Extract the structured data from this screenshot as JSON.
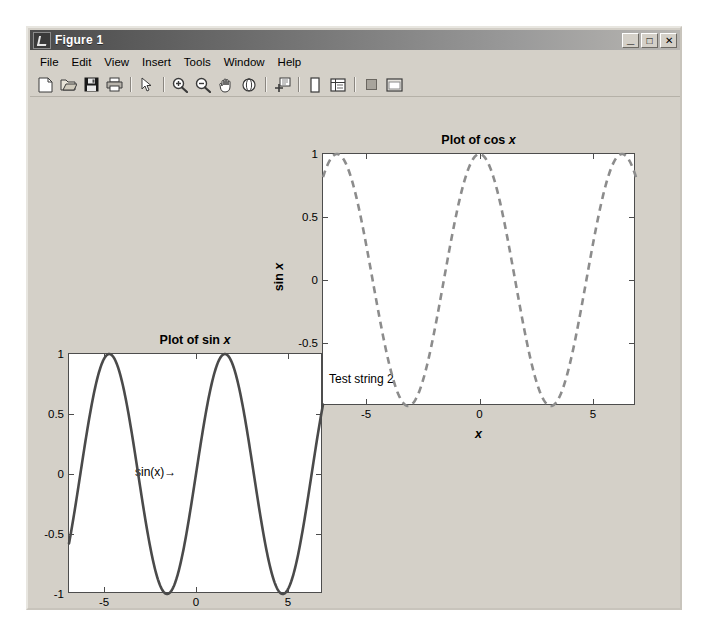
{
  "window": {
    "title": "Figure 1",
    "icon": "matlab-figure-icon",
    "buttons": {
      "minimize": "_",
      "maximize": "□",
      "close": "✕"
    }
  },
  "menubar": {
    "items": [
      {
        "label": "File",
        "name": "menu-file"
      },
      {
        "label": "Edit",
        "name": "menu-edit"
      },
      {
        "label": "View",
        "name": "menu-view"
      },
      {
        "label": "Insert",
        "name": "menu-insert"
      },
      {
        "label": "Tools",
        "name": "menu-tools"
      },
      {
        "label": "Window",
        "name": "menu-window"
      },
      {
        "label": "Help",
        "name": "menu-help"
      }
    ]
  },
  "toolbar": {
    "items": [
      {
        "name": "new-figure-icon"
      },
      {
        "name": "open-file-icon"
      },
      {
        "name": "save-figure-icon"
      },
      {
        "name": "print-figure-icon"
      },
      {
        "name": "separator"
      },
      {
        "name": "edit-plot-pointer-icon"
      },
      {
        "name": "separator"
      },
      {
        "name": "zoom-in-icon"
      },
      {
        "name": "zoom-out-icon"
      },
      {
        "name": "pan-hand-icon"
      },
      {
        "name": "rotate-3d-icon"
      },
      {
        "name": "separator"
      },
      {
        "name": "data-cursor-icon"
      },
      {
        "name": "separator"
      },
      {
        "name": "insert-colorbar-icon"
      },
      {
        "name": "insert-legend-icon"
      },
      {
        "name": "separator"
      },
      {
        "name": "hide-plot-tools-icon"
      },
      {
        "name": "show-plot-tools-icon"
      }
    ]
  },
  "chart_data": [
    {
      "id": "cos-plot",
      "type": "line",
      "title": "Plot of cos x",
      "title_plain": "Plot of cos ",
      "title_italic": "x",
      "xlabel": "x",
      "ylabel": "sin x",
      "ylabel_plain": "sin ",
      "ylabel_italic": "x",
      "xlim": [
        -6.9,
        6.9
      ],
      "ylim": [
        -1,
        1
      ],
      "xticks": [
        -5,
        0,
        5
      ],
      "xticklabels": [
        "-5",
        "0",
        "5"
      ],
      "yticks": [
        -1,
        -0.5,
        0,
        0.5,
        1
      ],
      "yticklabels": [
        "-1",
        "-0.5",
        "0",
        "0.5",
        "1"
      ],
      "grid": false,
      "linestyle": "dashed",
      "color": "#8c8c8c",
      "linewidth": 2.4,
      "series": [
        {
          "name": "cos(x)",
          "function": "cos",
          "amplitude": 1,
          "period": 6.2832
        }
      ],
      "annotations": [
        {
          "name": "test-string-2-annotation",
          "text": "Test string 2",
          "x": -6.3,
          "y": -0.82
        }
      ]
    },
    {
      "id": "sin-plot",
      "type": "line",
      "title": "Plot of sin x",
      "title_plain": "Plot of sin ",
      "title_italic": "x",
      "xlabel": "",
      "ylabel": "",
      "xlim": [
        -6.9,
        6.9
      ],
      "ylim": [
        -1,
        1
      ],
      "xticks": [
        -5,
        0,
        5
      ],
      "xticklabels": [
        "-5",
        "0",
        "5"
      ],
      "yticks": [
        -1,
        -0.5,
        0,
        0.5,
        1
      ],
      "yticklabels": [
        "-1",
        "-0.5",
        "0",
        "0.5",
        "1"
      ],
      "grid": false,
      "linestyle": "solid",
      "color": "#4a4a4a",
      "linewidth": 2.4,
      "series": [
        {
          "name": "sin(x)",
          "function": "sin",
          "amplitude": 1,
          "period": 6.2832
        }
      ],
      "annotations": [
        {
          "name": "sin-x-arrow-annotation",
          "text": "sin(x)→",
          "x": -3.6,
          "y": 0.02
        }
      ]
    }
  ],
  "colors": {
    "window_face": "#d4d0c8",
    "figure_background": "#d4d0c8",
    "axes_background": "#ffffff",
    "axes_line": "#4d4d4d",
    "cos_curve": "#8c8c8c",
    "sin_curve": "#4a4a4a",
    "titlebar_start": "#4a4a4a",
    "titlebar_end": "#b8b6b2"
  }
}
